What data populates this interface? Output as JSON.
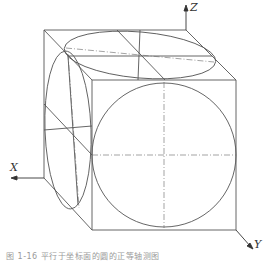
{
  "figure": {
    "axes": {
      "x": "X",
      "y": "Y",
      "z": "Z"
    },
    "caption": "图 1-16 平行于坐标面的圆的正等轴测图",
    "stroke_color": "#555555"
  }
}
